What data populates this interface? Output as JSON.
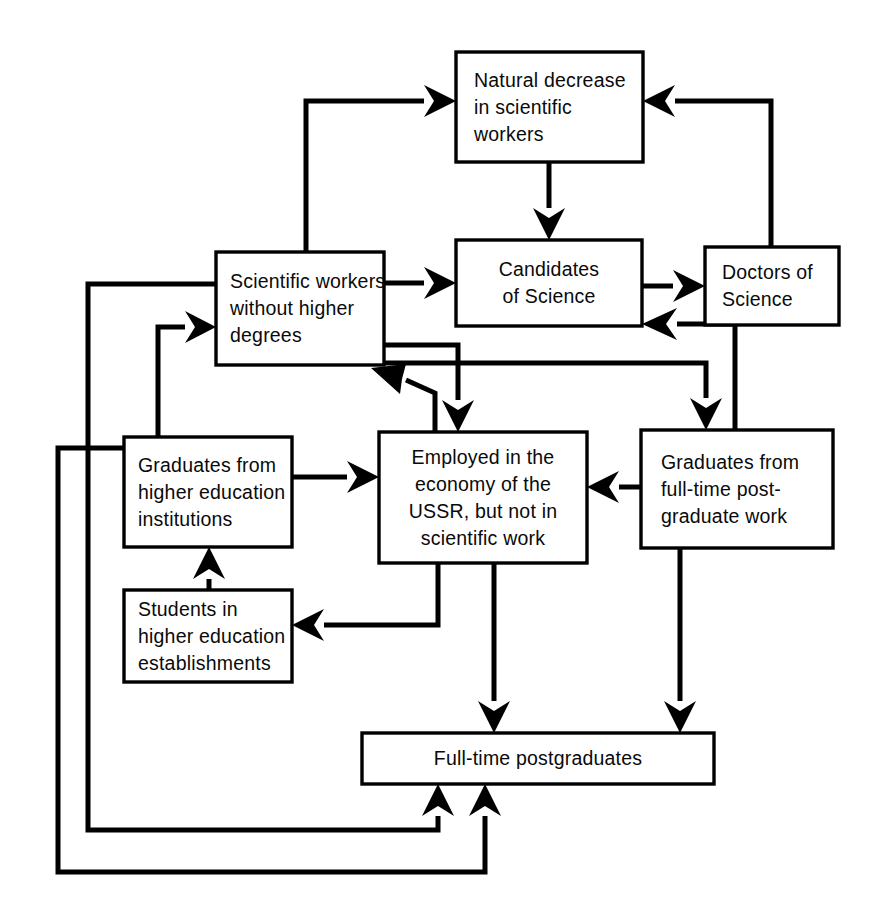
{
  "diagram": {
    "background_color": "#ffffff",
    "line_color": "#000000",
    "text_color": "#0a0a0a",
    "nodes": [
      {
        "id": "natural-decrease",
        "label": "Natural decrease\nin scientific\nworkers",
        "align": "left",
        "x": 456,
        "y": 52,
        "w": 187,
        "h": 110
      },
      {
        "id": "scientific-workers",
        "label": "Scientific workers\nwithout higher\ndegrees",
        "align": "left",
        "x": 216,
        "y": 252,
        "w": 168,
        "h": 113
      },
      {
        "id": "candidates-of-science",
        "label": "Candidates\nof Science",
        "align": "center",
        "x": 456,
        "y": 240,
        "w": 186,
        "h": 86
      },
      {
        "id": "doctors-of-science",
        "label": "Doctors of\nScience",
        "align": "left",
        "x": 705,
        "y": 247,
        "w": 134,
        "h": 78
      },
      {
        "id": "graduates-higher-education",
        "label": "Graduates from\nhigher education\ninstitutions",
        "align": "left",
        "x": 124,
        "y": 437,
        "w": 168,
        "h": 110
      },
      {
        "id": "employed-economy",
        "label": "Employed in the\neconomy of the\nUSSR, but not in\nscientific work",
        "align": "center",
        "x": 379,
        "y": 432,
        "w": 208,
        "h": 131
      },
      {
        "id": "graduates-postgraduate",
        "label": "Graduates from\nfull-time post-\ngraduate work",
        "align": "left",
        "x": 641,
        "y": 430,
        "w": 192,
        "h": 118
      },
      {
        "id": "students-higher-education",
        "label": "Students in\nhigher education\nestablishments",
        "align": "left",
        "x": 124,
        "y": 590,
        "w": 168,
        "h": 92
      },
      {
        "id": "full-time-postgraduates",
        "label": "Full-time postgraduates",
        "align": "center",
        "x": 362,
        "y": 733,
        "w": 352,
        "h": 51
      }
    ],
    "edges": [
      {
        "id": "scientific-workers-to-natural-decrease",
        "from": "scientific-workers",
        "to": "natural-decrease"
      },
      {
        "id": "scientific-workers-to-candidates",
        "from": "scientific-workers",
        "to": "candidates-of-science"
      },
      {
        "id": "natural-decrease-to-candidates",
        "from": "natural-decrease",
        "to": "candidates-of-science"
      },
      {
        "id": "candidates-to-doctors",
        "from": "candidates-of-science",
        "to": "doctors-of-science"
      },
      {
        "id": "doctors-to-natural-decrease",
        "from": "doctors-of-science",
        "to": "natural-decrease"
      },
      {
        "id": "scientific-workers-to-employed",
        "from": "scientific-workers",
        "to": "employed-economy"
      },
      {
        "id": "scientific-workers-to-graduates-postgraduate",
        "from": "scientific-workers",
        "to": "graduates-postgraduate"
      },
      {
        "id": "employed-to-scientific-workers",
        "from": "employed-economy",
        "to": "scientific-workers"
      },
      {
        "id": "graduates-postgraduate-to-candidates",
        "from": "graduates-postgraduate",
        "to": "candidates-of-science"
      },
      {
        "id": "graduates-postgraduate-to-employed",
        "from": "graduates-postgraduate",
        "to": "employed-economy"
      },
      {
        "id": "graduates-higher-education-to-employed",
        "from": "graduates-higher-education",
        "to": "employed-economy"
      },
      {
        "id": "graduates-higher-education-to-scientific-workers",
        "from": "graduates-higher-education",
        "to": "scientific-workers"
      },
      {
        "id": "students-to-graduates-higher-education",
        "from": "students-higher-education",
        "to": "graduates-higher-education"
      },
      {
        "id": "employed-to-students",
        "from": "employed-economy",
        "to": "students-higher-education"
      },
      {
        "id": "employed-to-full-time-postgraduates",
        "from": "employed-economy",
        "to": "full-time-postgraduates"
      },
      {
        "id": "graduates-postgraduate-to-full-time-postgraduates",
        "from": "graduates-postgraduate",
        "to": "full-time-postgraduates"
      },
      {
        "id": "scientific-workers-loop-to-full-time-postgraduates",
        "from": "scientific-workers",
        "to": "full-time-postgraduates"
      },
      {
        "id": "graduates-higher-education-loop-to-full-time-postgraduates",
        "from": "graduates-higher-education",
        "to": "full-time-postgraduates"
      }
    ]
  }
}
